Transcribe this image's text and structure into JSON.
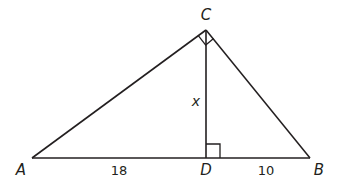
{
  "diagram": {
    "type": "right-triangle-with-altitude",
    "stroke_color": "#231f20",
    "vertices": {
      "A": {
        "label": "A",
        "x": 32,
        "y": 158
      },
      "B": {
        "label": "B",
        "x": 310,
        "y": 158
      },
      "C": {
        "label": "C",
        "x": 206,
        "y": 30
      },
      "D": {
        "label": "D",
        "x": 206,
        "y": 158
      }
    },
    "segments": {
      "AD": {
        "label": "18"
      },
      "DB": {
        "label": "10"
      },
      "CD": {
        "label": "x"
      }
    },
    "right_angles": [
      "ACB",
      "CDB"
    ]
  }
}
